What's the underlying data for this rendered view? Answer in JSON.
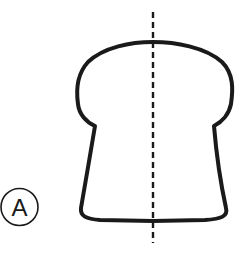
{
  "diagram": {
    "label": "A",
    "shape": "bread-slice-outline",
    "axis": "vertical-dashed-symmetry-line",
    "colors": {
      "stroke": "#1a1a1a",
      "background": "#ffffff"
    }
  }
}
